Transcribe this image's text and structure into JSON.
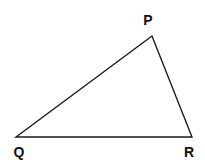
{
  "diagram": {
    "type": "triangle",
    "stroke_color": "#1a1a1a",
    "vertices": [
      {
        "name": "P",
        "x": 152,
        "y": 36
      },
      {
        "name": "Q",
        "x": 16,
        "y": 137
      },
      {
        "name": "R",
        "x": 192,
        "y": 137
      }
    ],
    "labels": {
      "p": "P",
      "q": "Q",
      "r": "R"
    },
    "edges": [
      [
        "P",
        "Q"
      ],
      [
        "Q",
        "R"
      ],
      [
        "R",
        "P"
      ]
    ]
  }
}
